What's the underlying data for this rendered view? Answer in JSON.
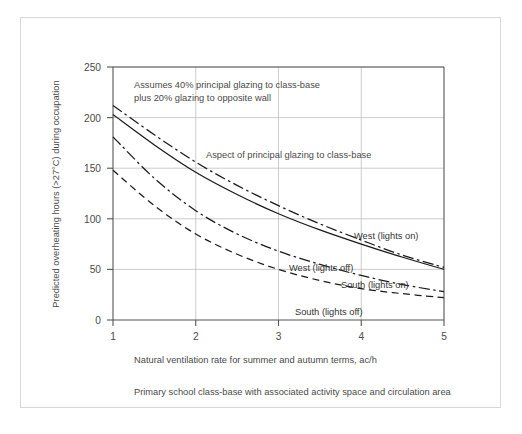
{
  "chart_data": {
    "type": "line",
    "title": "",
    "subtitle": "",
    "xlabel": "Natural ventilation rate for summer and autumn terms, ac/h",
    "ylabel": "Predicted overheating hours (>27°C) during occupation",
    "xlim": [
      1,
      5
    ],
    "ylim": [
      0,
      250
    ],
    "xticks": [
      1,
      2,
      3,
      4,
      5
    ],
    "yticks": [
      0,
      50,
      100,
      150,
      200,
      250
    ],
    "xtick_labels": [
      "1",
      "2",
      "3",
      "4",
      "5"
    ],
    "ytick_labels": [
      "0",
      "50",
      "100",
      "150",
      "200",
      "250"
    ],
    "grid": "both",
    "legend_position": "inline-labels",
    "x": [
      1,
      1.5,
      2,
      2.5,
      3,
      3.5,
      4,
      4.5,
      5
    ],
    "series": [
      {
        "name": "West (lights on)",
        "style": "dash-dot",
        "values": [
          212,
          183,
          156,
          133,
          113,
          95,
          79,
          64,
          52
        ]
      },
      {
        "name": "West (lights off)",
        "style": "solid",
        "values": [
          203,
          173,
          146,
          124,
          105,
          89,
          75,
          62,
          50
        ]
      },
      {
        "name": "South (lights on)",
        "style": "dash-dot",
        "values": [
          181,
          140,
          108,
          85,
          68,
          55,
          44,
          35,
          28
        ]
      },
      {
        "name": "South (lights off)",
        "style": "dashed",
        "values": [
          148,
          113,
          85,
          65,
          50,
          39,
          31,
          26,
          22
        ]
      }
    ],
    "annotations": [
      {
        "name": "assumptions-note",
        "lines": [
          "Assumes 40% principal glazing to class-base",
          "plus 20% glazing to opposite wall"
        ]
      },
      {
        "name": "aspect-note",
        "lines": [
          "Aspect of principal glazing to class-base"
        ]
      }
    ],
    "caption": "Primary school class-base with associated activity space and circulation area"
  },
  "figure": {
    "caption": "Primary school class-base with associated activity space and circulation area",
    "note_line1": "Assumes 40% principal glazing to class-base",
    "note_line2": "plus 20% glazing to opposite wall",
    "aspect_note": "Aspect of principal glazing to class-base",
    "x_axis_title": "Natural ventilation rate for summer and autumn terms, ac/h",
    "y_axis_title": "Predicted overheating hours (>27°C) during occupation",
    "labels": {
      "west_on": "West (lights on)",
      "west_off": "West (lights off)",
      "south_on": "South (lights on)",
      "south_off": "South (lights off)"
    },
    "yticks": {
      "t0": "0",
      "t50": "50",
      "t100": "100",
      "t150": "150",
      "t200": "200",
      "t250": "250"
    },
    "xticks": {
      "t1": "1",
      "t2": "2",
      "t3": "3",
      "t4": "4",
      "t5": "5"
    }
  }
}
